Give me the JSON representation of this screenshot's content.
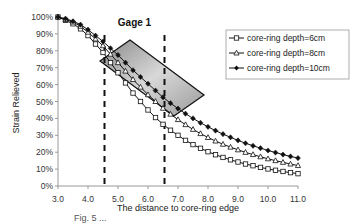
{
  "chart_data": {
    "type": "line",
    "title": "",
    "xlabel": "The distance to core-ring edge",
    "ylabel": "Strain Relieved",
    "xlim": [
      3.0,
      11.0
    ],
    "ylim": [
      0,
      100
    ],
    "x_ticks": [
      "3.0",
      "4.0",
      "5.0",
      "6.0",
      "7.0",
      "8.0",
      "9.0",
      "10.0",
      "11.0"
    ],
    "y_ticks": [
      "0%",
      "10%",
      "20%",
      "30%",
      "40%",
      "50%",
      "60%",
      "70%",
      "80%",
      "90%",
      "100%"
    ],
    "grid": false,
    "legend_position": "upper right",
    "x": [
      3.0,
      3.25,
      3.5,
      3.75,
      4.0,
      4.25,
      4.5,
      4.75,
      5.0,
      5.25,
      5.5,
      5.75,
      6.0,
      6.25,
      6.5,
      6.75,
      7.0,
      7.25,
      7.5,
      7.75,
      8.0,
      8.25,
      8.5,
      8.75,
      9.0,
      9.25,
      9.5,
      9.75,
      10.0,
      10.25,
      10.5,
      10.75,
      11.0
    ],
    "series": [
      {
        "name": "core-ring depth=6cm",
        "marker": "square-open",
        "values": [
          100,
          98,
          96,
          93,
          89,
          84,
          79,
          73,
          67,
          61,
          55,
          50,
          45,
          40.5,
          36.5,
          33,
          30,
          27,
          24.5,
          22.3,
          20.3,
          18.5,
          16.9,
          15.5,
          14.2,
          13,
          12,
          11,
          10.1,
          9.3,
          8.6,
          7.9,
          7.3
        ]
      },
      {
        "name": "core-ring depth=8cm",
        "marker": "triangle-open",
        "values": [
          100,
          98.5,
          97,
          94.5,
          91,
          87,
          83,
          78,
          73,
          68,
          63,
          58.5,
          54,
          50,
          46,
          42.5,
          39.3,
          36.3,
          33.5,
          31,
          28.7,
          26.6,
          24.7,
          23,
          21.4,
          19.9,
          18.6,
          17.3,
          16.1,
          15,
          14,
          13,
          12.1
        ]
      },
      {
        "name": "core-ring depth=10cm",
        "marker": "diamond-filled",
        "values": [
          100,
          99,
          97.5,
          95.5,
          92.5,
          89,
          85.5,
          81.5,
          77.5,
          73,
          68.5,
          64.5,
          60.5,
          56.5,
          52.5,
          49,
          45.8,
          42.8,
          40,
          37.4,
          35,
          32.8,
          30.7,
          28.8,
          27,
          25.3,
          23.8,
          22.4,
          21,
          19.8,
          18.6,
          17.5,
          16.5
        ]
      }
    ],
    "annotations": [
      {
        "type": "vline",
        "x": 4.55,
        "style": "dashed"
      },
      {
        "type": "vline",
        "x": 6.55,
        "style": "dashed"
      },
      {
        "type": "text",
        "text": "Gage 1",
        "x": 5.55,
        "y": 97
      },
      {
        "type": "rotated-rectangle",
        "label": "gage-1-region",
        "fill": "gray-gradient"
      }
    ]
  },
  "caption": "Fig. 5 ..."
}
